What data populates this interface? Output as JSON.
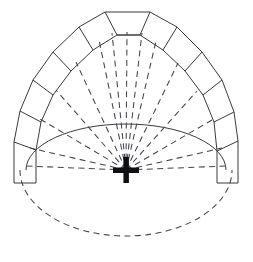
{
  "figure": {
    "title": "Fan vault radial plan",
    "type": "geometric-line-drawing",
    "background_color": "#ffffff",
    "stroke_color": "#3a3a42",
    "marker_color": "#101014",
    "canvas": {
      "width": 253,
      "height": 262
    }
  },
  "geometry": {
    "center_marker": {
      "name": "center-cross",
      "x": 126,
      "y": 170,
      "arm_length": 13,
      "arm_thickness": 5,
      "style": "solid-plus"
    },
    "inner_arc": {
      "name": "inner-solid-arc",
      "description": "Solid upper half of inner ellipse",
      "cx": 126,
      "cy": 170,
      "rx": 100,
      "ry": 46,
      "style": "solid"
    },
    "lower_ellipse": {
      "name": "lower-dashed-ellipse",
      "description": "Dashed lower half of outer ellipse",
      "cx": 126,
      "cy": 170,
      "rx": 106,
      "ry": 66,
      "style": "dashed"
    },
    "outer_band": {
      "name": "voussoir-band",
      "description": "Polygonal outer band of wedge segments",
      "inner_radius_x": 100,
      "inner_radius_y": 46,
      "band_thickness": 25,
      "segment_count": 12,
      "style": "solid"
    },
    "radial_ribs": {
      "name": "radial-rib-lines",
      "count": 13,
      "style": "dashed",
      "converge_at": "center-cross"
    },
    "end_blocks": {
      "left": {
        "name": "left-end-block",
        "x": 14,
        "y": 142,
        "width": 22,
        "height": 41
      },
      "right": {
        "name": "right-end-block",
        "x": 217,
        "y": 141,
        "width": 21,
        "height": 42
      }
    },
    "crown_block": {
      "name": "crown-block",
      "top_y": 12,
      "bottom_y": 33,
      "top_left_x": 105,
      "top_right_x": 150
    }
  },
  "labels": {
    "figure_caption": "",
    "center_label": "",
    "notes": ""
  }
}
